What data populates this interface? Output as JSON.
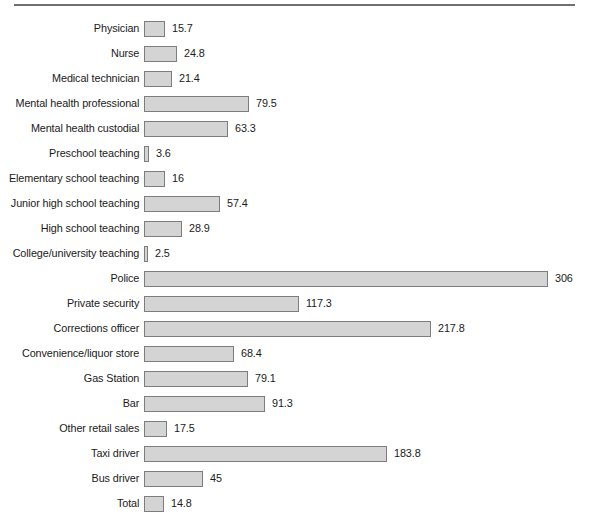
{
  "chart_data": {
    "type": "bar",
    "title": "",
    "subtitle": "",
    "xlabel": "",
    "ylabel": "",
    "orientation": "horizontal",
    "grid": false,
    "legend": null,
    "axis_visible": false,
    "value_labels": true,
    "xlim": [
      0,
      306
    ],
    "px_per_unit": 1.32,
    "categories": [
      "Physician",
      "Nurse",
      "Medical technician",
      "Mental health professional",
      "Mental health custodial",
      "Preschool teaching",
      "Elementary school teaching",
      "Junior high school teaching",
      "High school teaching",
      "College/university teaching",
      "Police",
      "Private security",
      "Corrections officer",
      "Convenience/liquor store",
      "Gas Station",
      "Bar",
      "Other retail sales",
      "Taxi driver",
      "Bus driver",
      "Total"
    ],
    "values": [
      15.7,
      24.8,
      21.4,
      79.5,
      63.3,
      3.6,
      16,
      57.4,
      28.9,
      2.5,
      306,
      117.3,
      217.8,
      68.4,
      79.1,
      91.3,
      17.5,
      183.8,
      45,
      14.8
    ],
    "value_labels_text": [
      "15.7",
      "24.8",
      "21.4",
      "79.5",
      "63.3",
      "3.6",
      "16",
      "57.4",
      "28.9",
      "2.5",
      "306",
      "117.3",
      "217.8",
      "68.4",
      "79.1",
      "91.3",
      "17.5",
      "183.8",
      "45",
      "14.8"
    ],
    "colors": {
      "bar_fill": "#d4d4d4",
      "bar_border": "#7d7d7d",
      "text": "#1a1a1a",
      "rule": "#6f6f6f",
      "background": "#ffffff"
    }
  }
}
